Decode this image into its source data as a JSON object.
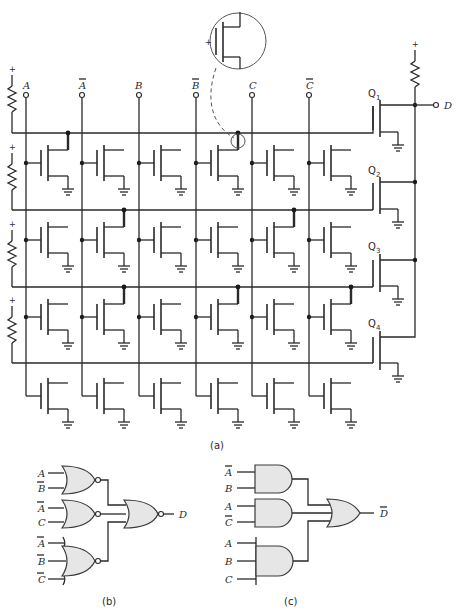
{
  "figure": {
    "part_a_caption": "(a)",
    "part_b_caption": "(b)",
    "part_c_caption": "(c)"
  },
  "array": {
    "columns": [
      {
        "id": "A",
        "label": "A",
        "overbar": false
      },
      {
        "id": "A_bar",
        "label": "A",
        "overbar": true
      },
      {
        "id": "B",
        "label": "B",
        "overbar": false
      },
      {
        "id": "B_bar",
        "label": "B",
        "overbar": true
      },
      {
        "id": "C",
        "label": "C",
        "overbar": false
      },
      {
        "id": "C_bar",
        "label": "C",
        "overbar": true
      }
    ],
    "supply_symbol": "+",
    "rows": [
      {
        "row": 1,
        "programmed_columns": [
          "A",
          "B_bar"
        ]
      },
      {
        "row": 2,
        "programmed_columns": [
          "A_bar",
          "C"
        ]
      },
      {
        "row": 3,
        "programmed_columns": [
          "A_bar",
          "B_bar",
          "C_bar"
        ]
      },
      {
        "row": 4,
        "programmed_columns": []
      }
    ],
    "output_transistors": [
      {
        "name": "Q",
        "sub": "1"
      },
      {
        "name": "Q",
        "sub": "2"
      },
      {
        "name": "Q",
        "sub": "3"
      },
      {
        "name": "Q",
        "sub": "4"
      }
    ],
    "output_label": "D",
    "callout_plus": "+"
  },
  "nor_circuit": {
    "gates": [
      {
        "type": "NOR",
        "inputs": [
          {
            "label": "A",
            "overbar": false
          },
          {
            "label": "B",
            "overbar": true
          }
        ]
      },
      {
        "type": "NOR",
        "inputs": [
          {
            "label": "A",
            "overbar": true
          },
          {
            "label": "C",
            "overbar": false
          }
        ]
      },
      {
        "type": "NOR",
        "inputs": [
          {
            "label": "A",
            "overbar": true
          },
          {
            "label": "B",
            "overbar": true
          },
          {
            "label": "C",
            "overbar": true
          }
        ]
      }
    ],
    "output_gate": "NOR",
    "output_label": "D",
    "output_overbar": false
  },
  "and_or_circuit": {
    "gates": [
      {
        "type": "AND",
        "inputs": [
          {
            "label": "A",
            "overbar": true
          },
          {
            "label": "B",
            "overbar": false
          }
        ]
      },
      {
        "type": "AND",
        "inputs": [
          {
            "label": "A",
            "overbar": false
          },
          {
            "label": "C",
            "overbar": true
          }
        ]
      },
      {
        "type": "AND",
        "inputs": [
          {
            "label": "A",
            "overbar": false
          },
          {
            "label": "B",
            "overbar": false
          },
          {
            "label": "C",
            "overbar": false
          }
        ]
      }
    ],
    "output_gate": "OR",
    "output_label": "D",
    "output_overbar": true
  }
}
